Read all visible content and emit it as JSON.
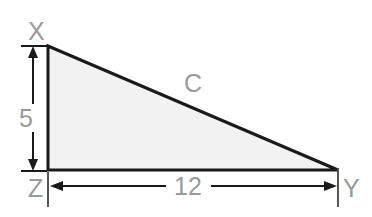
{
  "figure": {
    "type": "geometry-diagram",
    "shape": "right-triangle",
    "background_color": "#ffffff",
    "fill_color": "#f2f2f2",
    "stroke_color": "#1a1a1a",
    "label_color": "#9a9a9a",
    "vertices": [
      {
        "id": "vertex-x",
        "label": "X",
        "x": 48,
        "y": 46
      },
      {
        "id": "vertex-y",
        "label": "Y",
        "x": 338,
        "y": 170
      },
      {
        "id": "vertex-z",
        "label": "Z",
        "x": 48,
        "y": 170
      }
    ],
    "side_labels": [
      {
        "id": "hypotenuse-label",
        "label": "C",
        "x": 193,
        "y": 92
      }
    ],
    "dimensions": [
      {
        "id": "vertical-dimension",
        "label": "5",
        "orientation": "vertical",
        "label_x": 26,
        "label_y": 118,
        "line_x": 33,
        "from_y": 46,
        "to_y": 170
      },
      {
        "id": "horizontal-dimension",
        "label": "12",
        "orientation": "horizontal",
        "label_x": 183,
        "label_y": 194,
        "line_y": 186,
        "from_x": 50,
        "to_x": 336
      }
    ]
  }
}
